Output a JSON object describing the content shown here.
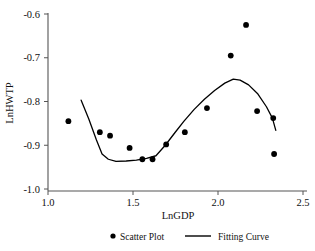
{
  "chart_data": {
    "type": "scatter",
    "title": "",
    "xlabel": "LnGDP",
    "ylabel": "LnHWTP",
    "xlim": [
      1.0,
      2.5
    ],
    "ylim": [
      -1.0,
      -0.6
    ],
    "xticks": [
      "1.0",
      "1.5",
      "2.0",
      "2.5"
    ],
    "xtick_values": [
      1.0,
      1.5,
      2.0,
      2.5
    ],
    "yticks": [
      "-0.6",
      "-0.7",
      "-0.8",
      "-0.9",
      "-1.0"
    ],
    "ytick_values": [
      -0.6,
      -0.7,
      -0.8,
      -0.9,
      -1.0
    ],
    "grid": false,
    "legend_position": "below",
    "series": [
      {
        "name": "Scatter Plot",
        "type": "scatter",
        "marker": "circle",
        "color": "#000000",
        "points": [
          {
            "x": 1.12,
            "y": -0.845
          },
          {
            "x": 1.305,
            "y": -0.87
          },
          {
            "x": 1.365,
            "y": -0.878
          },
          {
            "x": 1.48,
            "y": -0.906
          },
          {
            "x": 1.555,
            "y": -0.932
          },
          {
            "x": 1.615,
            "y": -0.932
          },
          {
            "x": 1.695,
            "y": -0.898
          },
          {
            "x": 1.805,
            "y": -0.87
          },
          {
            "x": 1.935,
            "y": -0.815
          },
          {
            "x": 2.075,
            "y": -0.695
          },
          {
            "x": 2.165,
            "y": -0.625
          },
          {
            "x": 2.23,
            "y": -0.822
          },
          {
            "x": 2.325,
            "y": -0.838
          },
          {
            "x": 2.33,
            "y": -0.92
          }
        ]
      },
      {
        "name": "Fitting Curve",
        "type": "line",
        "color": "#000000",
        "points": [
          {
            "x": 1.195,
            "y": -0.797
          },
          {
            "x": 1.24,
            "y": -0.84
          },
          {
            "x": 1.285,
            "y": -0.888
          },
          {
            "x": 1.318,
            "y": -0.92
          },
          {
            "x": 1.355,
            "y": -0.932
          },
          {
            "x": 1.4,
            "y": -0.937
          },
          {
            "x": 1.46,
            "y": -0.936
          },
          {
            "x": 1.52,
            "y": -0.934
          },
          {
            "x": 1.58,
            "y": -0.93
          },
          {
            "x": 1.635,
            "y": -0.924
          },
          {
            "x": 1.69,
            "y": -0.9
          },
          {
            "x": 1.745,
            "y": -0.872
          },
          {
            "x": 1.8,
            "y": -0.845
          },
          {
            "x": 1.86,
            "y": -0.818
          },
          {
            "x": 1.92,
            "y": -0.795
          },
          {
            "x": 1.98,
            "y": -0.775
          },
          {
            "x": 2.04,
            "y": -0.758
          },
          {
            "x": 2.09,
            "y": -0.749
          },
          {
            "x": 2.13,
            "y": -0.751
          },
          {
            "x": 2.18,
            "y": -0.762
          },
          {
            "x": 2.235,
            "y": -0.783
          },
          {
            "x": 2.285,
            "y": -0.812
          },
          {
            "x": 2.32,
            "y": -0.838
          },
          {
            "x": 2.34,
            "y": -0.866
          }
        ]
      }
    ]
  },
  "legend": {
    "scatter_label": "Scatter Plot",
    "curve_label": "Fitting Curve"
  }
}
